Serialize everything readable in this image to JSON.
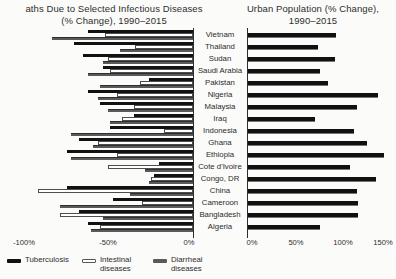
{
  "figure": {
    "left_title_line1": "aths Due to Selected Infectious Diseases",
    "left_title_line2": "(% Change), 1990–2015",
    "right_title_line1": "Urban Population (% Change),",
    "right_title_line2": "1990–2015"
  },
  "left_axis_ticks": [
    "-100%",
    "-50%",
    "0%"
  ],
  "right_axis_ticks": [
    "0%",
    "50%",
    "100%",
    "150%"
  ],
  "legend": {
    "items": [
      {
        "label": "Tuberculosis",
        "color": "#111111",
        "swatch": "solid-black"
      },
      {
        "label": "Intestinal diseases",
        "color": "#ffffff",
        "swatch": "outlined-white"
      },
      {
        "label": "Diarrheal diseases",
        "color": "#5a5a5a",
        "swatch": "solid-gray"
      }
    ]
  },
  "colors": {
    "bar_black": "#111111",
    "bar_white": "#ffffff",
    "bar_white_border": "#4d4d4d",
    "bar_gray": "#5a5a5a",
    "axis_line": "#2e2e2e",
    "text": "#222222",
    "background": "#fbfbfa"
  },
  "chart_data": [
    {
      "type": "bar",
      "orientation": "horizontal",
      "title": "aths Due to Selected Infectious Diseases (% Change), 1990–2015",
      "categories": [
        "Vietnam",
        "Thailand",
        "Sudan",
        "Saudi Arabia",
        "Pakistan",
        "Nigeria",
        "Malaysia",
        "Iraq",
        "Indonesia",
        "Ghana",
        "Ethiopia",
        "Cote d'Ivoire",
        "Congo, DR",
        "China",
        "Cameroon",
        "Bangladesh",
        "Algeria"
      ],
      "series": [
        {
          "name": "Tuberculosis",
          "values": [
            -62,
            -70,
            -65,
            -53,
            -26,
            -62,
            -55,
            -35,
            -49,
            -67,
            -74,
            -20,
            -23,
            -74,
            -47,
            -67,
            -62
          ]
        },
        {
          "name": "Intestinal diseases",
          "values": [
            -52,
            -34,
            -50,
            -49,
            -31,
            -45,
            -35,
            -42,
            -17,
            -56,
            -45,
            -50,
            -25,
            -91,
            -30,
            -78,
            -55
          ]
        },
        {
          "name": "Diarrheal diseases",
          "values": [
            -83,
            -43,
            -53,
            -62,
            -55,
            -56,
            -50,
            -49,
            -72,
            -59,
            -72,
            -28,
            -26,
            -37,
            -78,
            -53,
            -60
          ]
        }
      ],
      "xlim": [
        -103,
        0
      ],
      "tick_labels": [
        "-100%",
        "-50%",
        "0%"
      ],
      "tick_values": [
        -100,
        -50,
        0
      ],
      "legend_position": "bottom-left",
      "grid": false
    },
    {
      "type": "bar",
      "orientation": "horizontal",
      "title": "Urban Population (% Change), 1990–2015",
      "categories": [
        "Vietnam",
        "Thailand",
        "Sudan",
        "Saudi Arabia",
        "Pakistan",
        "Nigeria",
        "Malaysia",
        "Iraq",
        "Indonesia",
        "Ghana",
        "Ethiopia",
        "Cote d'Ivoire",
        "Congo, DR",
        "China",
        "Cameroon",
        "Bangladesh",
        "Algeria"
      ],
      "values": [
        95,
        76,
        94,
        78,
        86,
        139,
        117,
        72,
        114,
        128,
        146,
        110,
        137,
        117,
        118,
        118,
        78
      ],
      "xlim": [
        0,
        158
      ],
      "tick_labels": [
        "0%",
        "50%",
        "100%",
        "150%"
      ],
      "tick_values": [
        0,
        50,
        100,
        150
      ],
      "grid": false
    }
  ]
}
